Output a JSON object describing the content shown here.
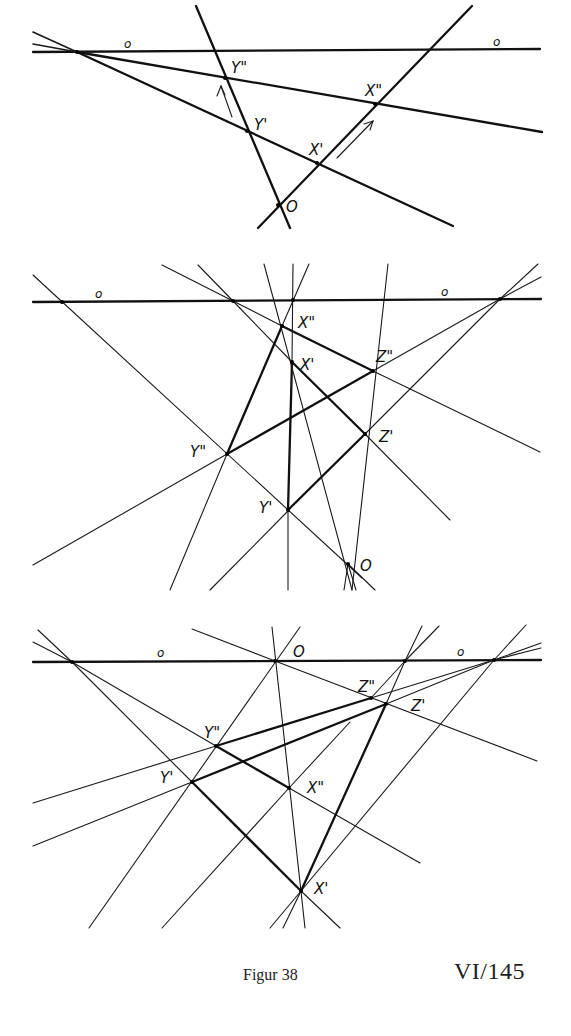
{
  "figure": {
    "caption": "Figur 38",
    "page_ref": "VI/145",
    "panels": [
      {
        "id": "top",
        "axis_label_left": "o",
        "axis_label_right": "o",
        "points": [
          "Y''",
          "Y'",
          "X''",
          "X'",
          "O"
        ]
      },
      {
        "id": "middle",
        "axis_label_left": "o",
        "axis_label_right": "o",
        "points": [
          "X''",
          "X'",
          "Z''",
          "Z'",
          "Y''",
          "Y'",
          "O"
        ]
      },
      {
        "id": "bottom",
        "axis_label_left": "o",
        "axis_label_right": "o",
        "points": [
          "O",
          "Z''",
          "Z'",
          "Y''",
          "Y'",
          "X''",
          "X'"
        ]
      }
    ]
  },
  "labels": {
    "o": "o",
    "O": "O",
    "X1": "X'",
    "X2": "X\"",
    "Y1": "Y'",
    "Y2": "Y\"",
    "Z1": "Z'",
    "Z2": "Z\""
  }
}
